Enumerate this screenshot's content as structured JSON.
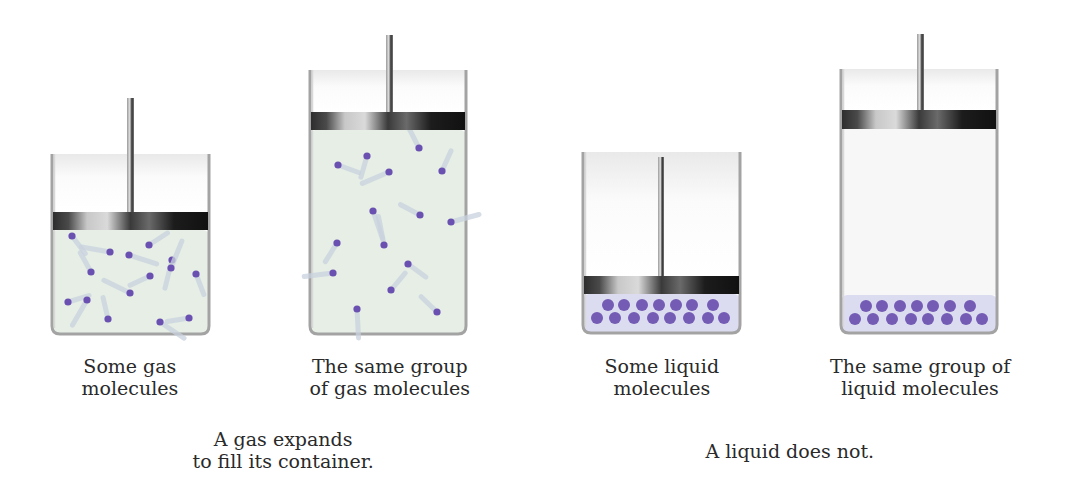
{
  "colors": {
    "gas_fill": "#e6eee6",
    "liquid_fill": "#dcdcf0",
    "molecule": "#6a50b0",
    "tail": "#c9d2de",
    "wall": "#9a9a9a",
    "empty": "#f7f7f7"
  },
  "panels": [
    {
      "id": "gas-small",
      "kind": "gas",
      "box": {
        "x": 52,
        "y": 154,
        "w": 157,
        "h": 180
      },
      "piston": {
        "top": 212,
        "h": 18
      },
      "rod": {
        "x": 127,
        "w": 7,
        "top": 98
      },
      "caption": [
        "Some gas",
        "molecules"
      ],
      "caption_pos": {
        "cx": 130,
        "y": 355
      },
      "molecules": [
        [
          72,
          236
        ],
        [
          110,
          252
        ],
        [
          149,
          245
        ],
        [
          172,
          260
        ],
        [
          91,
          272
        ],
        [
          129,
          255
        ],
        [
          150,
          276
        ],
        [
          171,
          268
        ],
        [
          196,
          274
        ],
        [
          130,
          293
        ],
        [
          68,
          302
        ],
        [
          87,
          300
        ],
        [
          108,
          319
        ],
        [
          160,
          322
        ],
        [
          189,
          318
        ]
      ]
    },
    {
      "id": "gas-large",
      "kind": "gas",
      "box": {
        "x": 310,
        "y": 70,
        "w": 156,
        "h": 264
      },
      "piston": {
        "top": 112,
        "h": 18
      },
      "rod": {
        "x": 386,
        "w": 7,
        "top": 35
      },
      "caption": [
        "The same group",
        "of gas molecules"
      ],
      "caption_pos": {
        "cx": 390,
        "y": 355
      },
      "molecules": [
        [
          367,
          156
        ],
        [
          419,
          148
        ],
        [
          338,
          165
        ],
        [
          389,
          172
        ],
        [
          442,
          171
        ],
        [
          373,
          211
        ],
        [
          420,
          215
        ],
        [
          451,
          222
        ],
        [
          337,
          243
        ],
        [
          384,
          245
        ],
        [
          408,
          264
        ],
        [
          333,
          273
        ],
        [
          391,
          290
        ],
        [
          357,
          309
        ],
        [
          437,
          312
        ]
      ]
    },
    {
      "id": "liquid-small",
      "kind": "liquid",
      "box": {
        "x": 583,
        "y": 152,
        "w": 157,
        "h": 181
      },
      "piston": {
        "top": 276,
        "h": 18
      },
      "rod": {
        "x": 658,
        "w": 6,
        "top": 157
      },
      "liquid_top": 294,
      "caption": [
        "Some liquid",
        "molecules"
      ],
      "caption_pos": {
        "cx": 662,
        "y": 355
      },
      "molecules": [
        [
          608,
          305
        ],
        [
          624,
          305
        ],
        [
          642,
          305
        ],
        [
          659,
          305
        ],
        [
          676,
          305
        ],
        [
          692,
          305
        ],
        [
          713,
          305
        ],
        [
          597,
          318
        ],
        [
          615,
          318
        ],
        [
          634,
          318
        ],
        [
          653,
          318
        ],
        [
          670,
          318
        ],
        [
          689,
          318
        ],
        [
          708,
          318
        ],
        [
          724,
          318
        ]
      ]
    },
    {
      "id": "liquid-large",
      "kind": "liquid",
      "box": {
        "x": 841,
        "y": 69,
        "w": 156,
        "h": 264
      },
      "piston": {
        "top": 110,
        "h": 19
      },
      "rod": {
        "x": 917,
        "w": 7,
        "top": 34
      },
      "liquid_top": 295,
      "caption": [
        "The same group of",
        "liquid molecules"
      ],
      "caption_pos": {
        "cx": 920,
        "y": 355
      },
      "molecules": [
        [
          866,
          306
        ],
        [
          882,
          306
        ],
        [
          900,
          306
        ],
        [
          917,
          306
        ],
        [
          933,
          306
        ],
        [
          950,
          306
        ],
        [
          970,
          306
        ],
        [
          855,
          319
        ],
        [
          873,
          319
        ],
        [
          892,
          319
        ],
        [
          911,
          319
        ],
        [
          928,
          319
        ],
        [
          947,
          319
        ],
        [
          966,
          319
        ],
        [
          982,
          319
        ]
      ]
    }
  ],
  "summaries": [
    {
      "id": "gas-summary",
      "lines": [
        "A gas expands",
        "to fill its container."
      ],
      "cx": 283,
      "y": 428
    },
    {
      "id": "liquid-summary",
      "lines": [
        "A liquid does not."
      ],
      "cx": 790,
      "y": 440
    }
  ]
}
